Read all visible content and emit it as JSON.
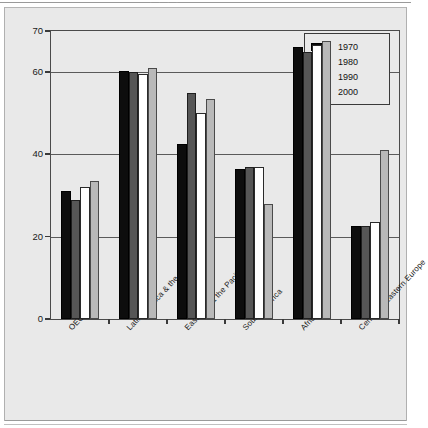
{
  "figure": {
    "background_color": "#e9e9e9",
    "frame_color": "#8a8a8a",
    "scan_artifact_text": ". . . ."
  },
  "legend": {
    "position": "top-right",
    "entries": [
      {
        "label": "1970",
        "color": "#0d0d0d"
      },
      {
        "label": "1980",
        "color": "#565656"
      },
      {
        "label": "1990",
        "color": "#ffffff"
      },
      {
        "label": "2000",
        "color": "#b9b9b9"
      }
    ]
  },
  "chart_data": {
    "type": "bar",
    "title": "",
    "subtitle": "",
    "xlabel": "",
    "ylabel": "",
    "ylim": [
      0,
      70
    ],
    "yticks": [
      0,
      20,
      40,
      60,
      70
    ],
    "ytick_labels": [
      "0",
      "20",
      "40",
      "60",
      "70"
    ],
    "grid": true,
    "grid_axis": "y",
    "legend_position": "upper right",
    "categories": [
      "OECD",
      "Latin America & the Caribbean",
      "East Asia & the Pacific",
      "South America",
      "Africa",
      "Central & Eastern Europe"
    ],
    "series": [
      {
        "name": "1970",
        "color": "#0d0d0d",
        "values": [
          31.0,
          60.3,
          42.5,
          36.5,
          66.0,
          22.5
        ]
      },
      {
        "name": "1980",
        "color": "#565656",
        "values": [
          29.0,
          60.0,
          55.0,
          37.0,
          65.0,
          22.5
        ]
      },
      {
        "name": "1990",
        "color": "#ffffff",
        "values": [
          32.0,
          59.5,
          50.0,
          37.0,
          66.5,
          23.5
        ]
      },
      {
        "name": "2000",
        "color": "#b9b9b9",
        "values": [
          33.5,
          61.0,
          53.5,
          28.0,
          67.5,
          41.0
        ]
      }
    ]
  }
}
